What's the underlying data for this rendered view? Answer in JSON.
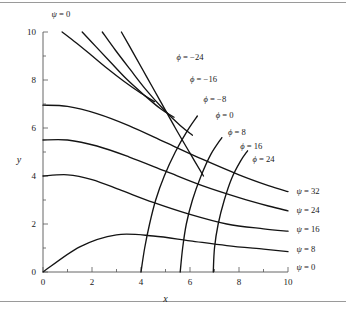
{
  "figure": {
    "background": "#ffffff",
    "border_color": "#9a9a9a",
    "curve_color": "#141414",
    "axis_color": "#555555"
  },
  "chart_data": {
    "type": "line",
    "title": "",
    "subtitle": "",
    "xlabel": "x",
    "ylabel": "y",
    "xlim": [
      0,
      10
    ],
    "ylim": [
      0,
      10
    ],
    "grid": false,
    "legend_position": "inline-labels",
    "x_ticks_major": [
      0,
      2,
      4,
      6,
      8,
      10
    ],
    "x_ticks_minor": [
      1,
      3,
      5,
      7,
      9
    ],
    "y_ticks_major": [
      0,
      2,
      4,
      6,
      8,
      10
    ],
    "y_ticks_minor": [
      1,
      3,
      5,
      7,
      9
    ],
    "x_tick_labels": [
      "0",
      "2",
      "4",
      "6",
      "8",
      "10"
    ],
    "y_tick_labels": [
      "0",
      "2",
      "4",
      "6",
      "8",
      "10"
    ],
    "series": [
      {
        "name": "phi = -24",
        "family": "phi",
        "value": -24,
        "label": "ϕ = −24",
        "label_x": 5.45,
        "label_y": 8.95,
        "points": [
          [
            0.78,
            10.0
          ],
          [
            1.35,
            9.55
          ],
          [
            1.95,
            9.05
          ],
          [
            2.6,
            8.5
          ],
          [
            3.3,
            7.95
          ],
          [
            4.0,
            7.45
          ],
          [
            4.55,
            7.1
          ]
        ]
      },
      {
        "name": "phi = -16",
        "family": "phi",
        "value": -16,
        "label": "ϕ = −16",
        "label_x": 6.0,
        "label_y": 8.05,
        "points": [
          [
            1.6,
            10.0
          ],
          [
            2.15,
            9.4
          ],
          [
            2.75,
            8.75
          ],
          [
            3.4,
            8.05
          ],
          [
            4.1,
            7.4
          ],
          [
            4.8,
            6.8
          ],
          [
            5.35,
            6.45
          ]
        ]
      },
      {
        "name": "phi = -8",
        "family": "phi",
        "value": -8,
        "label": "ϕ = −8",
        "label_x": 6.55,
        "label_y": 7.2,
        "points": [
          [
            2.42,
            10.0
          ],
          [
            2.95,
            9.25
          ],
          [
            3.55,
            8.45
          ],
          [
            4.2,
            7.6
          ],
          [
            4.9,
            6.8
          ],
          [
            5.6,
            6.1
          ],
          [
            6.1,
            5.7
          ]
        ]
      },
      {
        "name": "phi = 0",
        "family": "phi",
        "value": 0,
        "label": "ϕ = 0",
        "label_x": 7.05,
        "label_y": 6.55,
        "points": [
          [
            3.2,
            10.0
          ],
          [
            3.7,
            9.1
          ],
          [
            4.25,
            8.1
          ],
          [
            4.8,
            7.1
          ],
          [
            5.4,
            6.0
          ],
          [
            6.0,
            4.95
          ],
          [
            6.55,
            4.0
          ]
        ]
      },
      {
        "name": "phi = 8",
        "family": "phi",
        "value": 8,
        "label": "ϕ = 8",
        "label_x": 7.55,
        "label_y": 5.85,
        "points": [
          [
            4.0,
            0.0
          ],
          [
            4.15,
            1.0
          ],
          [
            4.35,
            2.0
          ],
          [
            4.6,
            3.0
          ],
          [
            4.95,
            4.0
          ],
          [
            5.4,
            5.0
          ],
          [
            5.9,
            5.9
          ],
          [
            6.3,
            6.5
          ]
        ]
      },
      {
        "name": "phi = 16",
        "family": "phi",
        "value": 16,
        "label": "ϕ = 16",
        "label_x": 8.05,
        "label_y": 5.25,
        "points": [
          [
            5.6,
            0.0
          ],
          [
            5.7,
            1.0
          ],
          [
            5.85,
            2.0
          ],
          [
            6.1,
            3.0
          ],
          [
            6.45,
            4.0
          ],
          [
            6.85,
            4.9
          ],
          [
            7.3,
            5.6
          ]
        ]
      },
      {
        "name": "phi = 24",
        "family": "phi",
        "value": 24,
        "label": "ϕ = 24",
        "label_x": 8.55,
        "label_y": 4.7,
        "points": [
          [
            6.95,
            0.0
          ],
          [
            7.0,
            1.0
          ],
          [
            7.15,
            2.0
          ],
          [
            7.4,
            3.0
          ],
          [
            7.7,
            3.9
          ],
          [
            8.05,
            4.6
          ],
          [
            8.35,
            5.05
          ]
        ]
      },
      {
        "name": "psi = 0 (vertical axis branch)",
        "family": "psi",
        "value": 0,
        "label": "ψ = 0",
        "label_x": 0.35,
        "label_y": 10.75,
        "label_anchor": "top-axis",
        "points": [
          [
            0.0,
            10.0
          ],
          [
            0.0,
            0.0
          ]
        ]
      },
      {
        "name": "psi = 0 (horizontal axis branch)",
        "family": "psi",
        "value": 0,
        "label": "ψ = 0",
        "label_x": 10.35,
        "label_y": 0.2,
        "label_anchor": "right",
        "points": [
          [
            0.0,
            0.0
          ],
          [
            10.0,
            0.0
          ]
        ]
      },
      {
        "name": "psi = 8",
        "family": "psi",
        "value": 8,
        "label": "ψ = 8",
        "label_x": 10.35,
        "label_y": 0.95,
        "label_anchor": "right",
        "points": [
          [
            0.0,
            0.0
          ],
          [
            1.5,
            1.05
          ],
          [
            3.0,
            1.55
          ],
          [
            4.5,
            1.5
          ],
          [
            6.0,
            1.3
          ],
          [
            7.5,
            1.1
          ],
          [
            9.0,
            0.95
          ],
          [
            10.0,
            0.85
          ]
        ]
      },
      {
        "name": "psi = 16",
        "family": "psi",
        "value": 16,
        "label": "ψ = 16",
        "label_x": 10.35,
        "label_y": 1.8,
        "label_anchor": "right",
        "points": [
          [
            0.0,
            4.0
          ],
          [
            1.0,
            4.05
          ],
          [
            2.0,
            3.85
          ],
          [
            3.2,
            3.4
          ],
          [
            4.5,
            2.9
          ],
          [
            6.0,
            2.4
          ],
          [
            7.5,
            2.0
          ],
          [
            9.0,
            1.8
          ],
          [
            10.0,
            1.7
          ]
        ]
      },
      {
        "name": "psi = 24",
        "family": "psi",
        "value": 24,
        "label": "ψ = 24",
        "label_x": 10.35,
        "label_y": 2.6,
        "label_anchor": "right",
        "points": [
          [
            0.0,
            5.5
          ],
          [
            1.0,
            5.5
          ],
          [
            2.2,
            5.25
          ],
          [
            3.5,
            4.8
          ],
          [
            5.0,
            4.2
          ],
          [
            6.5,
            3.6
          ],
          [
            8.0,
            3.1
          ],
          [
            9.2,
            2.75
          ],
          [
            10.0,
            2.55
          ]
        ]
      },
      {
        "name": "psi = 32",
        "family": "psi",
        "value": 32,
        "label": "ψ = 32",
        "label_x": 10.35,
        "label_y": 3.4,
        "label_anchor": "right",
        "points": [
          [
            0.0,
            6.95
          ],
          [
            1.0,
            6.9
          ],
          [
            2.2,
            6.6
          ],
          [
            3.5,
            6.1
          ],
          [
            5.0,
            5.4
          ],
          [
            6.5,
            4.7
          ],
          [
            8.0,
            4.05
          ],
          [
            9.2,
            3.6
          ],
          [
            10.0,
            3.35
          ]
        ]
      }
    ],
    "phi_levels": [
      -24,
      -16,
      -8,
      0,
      8,
      16,
      24
    ],
    "psi_levels": [
      0,
      8,
      16,
      24,
      32
    ],
    "annotations": [
      {
        "text": "ψ = 0",
        "x": 0.35,
        "y": 10.75,
        "anchor": "start"
      },
      {
        "text": "ϕ = −24",
        "x": 5.45,
        "y": 8.95,
        "anchor": "start"
      },
      {
        "text": "ϕ = −16",
        "x": 6.0,
        "y": 8.05,
        "anchor": "start"
      },
      {
        "text": "ϕ = −8",
        "x": 6.55,
        "y": 7.2,
        "anchor": "start"
      },
      {
        "text": "ϕ = 0",
        "x": 7.05,
        "y": 6.55,
        "anchor": "start"
      },
      {
        "text": "ϕ = 8",
        "x": 7.55,
        "y": 5.85,
        "anchor": "start"
      },
      {
        "text": "ϕ = 16",
        "x": 8.05,
        "y": 5.25,
        "anchor": "start"
      },
      {
        "text": "ϕ = 24",
        "x": 8.55,
        "y": 4.7,
        "anchor": "start"
      },
      {
        "text": "ψ = 32",
        "x": 10.35,
        "y": 3.4,
        "anchor": "start"
      },
      {
        "text": "ψ = 24",
        "x": 10.35,
        "y": 2.6,
        "anchor": "start"
      },
      {
        "text": "ψ = 16",
        "x": 10.35,
        "y": 1.8,
        "anchor": "start"
      },
      {
        "text": "ψ = 8",
        "x": 10.35,
        "y": 0.95,
        "anchor": "start"
      },
      {
        "text": "ψ = 0",
        "x": 10.35,
        "y": 0.2,
        "anchor": "start"
      }
    ]
  },
  "axes": {
    "x_label": "x",
    "y_label": "y"
  }
}
